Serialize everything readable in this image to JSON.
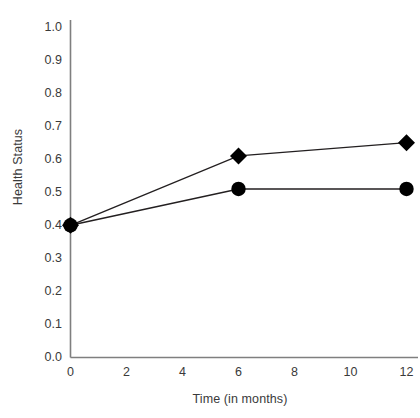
{
  "chart_data": {
    "type": "line",
    "title": "",
    "subtitle": "",
    "xlabel": "Time (in months)",
    "ylabel": "Health Status",
    "x": [
      0,
      6,
      12
    ],
    "xlim": [
      0,
      12
    ],
    "ylim": [
      0.0,
      1.0
    ],
    "xticks": [
      "0",
      "2",
      "4",
      "6",
      "8",
      "10",
      "12"
    ],
    "xtick_values": [
      0,
      2,
      4,
      6,
      8,
      10,
      12
    ],
    "yticks": [
      "0.0",
      "0.1",
      "0.2",
      "0.3",
      "0.4",
      "0.5",
      "0.6",
      "0.7",
      "0.8",
      "0.9",
      "1.0"
    ],
    "ytick_values": [
      0.0,
      0.1,
      0.2,
      0.3,
      0.4,
      0.5,
      0.6,
      0.7,
      0.8,
      0.9,
      1.0
    ],
    "grid": false,
    "legend": "none",
    "series": [
      {
        "name": "diamond-series",
        "marker": "diamond",
        "color": "#000000",
        "values": [
          0.4,
          0.61,
          0.65
        ]
      },
      {
        "name": "circle-series",
        "marker": "circle",
        "color": "#000000",
        "values": [
          0.4,
          0.51,
          0.51
        ]
      }
    ],
    "axis_color": "#7f7f7f",
    "line_color": "#231f20",
    "background": "#ffffff"
  }
}
